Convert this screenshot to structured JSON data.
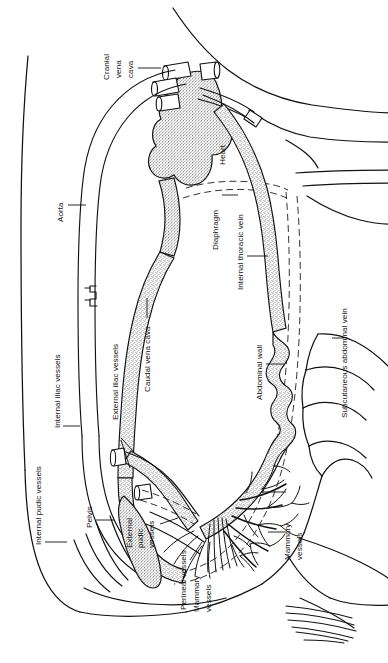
{
  "figure": {
    "kind": "anatomical-line-drawing",
    "orientation": "rotated-90",
    "background_color": "#ffffff",
    "ink_color": "#111111"
  },
  "labels": {
    "cranial_vena_cava": "Cranial\nvena\ncava",
    "cranial_vena_cava_l1": "Cranial",
    "cranial_vena_cava_l2": "vena",
    "cranial_vena_cava_l3": "cava",
    "heart": "Heart",
    "aorta": "Aorta",
    "diaphragm": "Diaphragm",
    "internal_thoracic_vein": "Internal thoracic vein",
    "caudal_vena_cava": "Caudal vena cava",
    "abdominal_wall": "Abdominal wall",
    "subcutaneous_abdominal_vein": "Subcutaneous abdominal vein",
    "external_iliac_vessels": "External iliac vessels",
    "internal_iliac_vessels": "Internal iliac vessels",
    "internal_pudic_vessels": "Internal pudic vessels",
    "pelvis": "Pelvis",
    "external_pudic_vessels_l1": "External",
    "external_pudic_vessels_l2": "pudic",
    "external_pudic_vessels_l3": "vessels",
    "perineal_vessels": "Perineal vessels",
    "mammary_vessels_right_l1": "Mammary",
    "mammary_vessels_right_l2": "vessels",
    "mammary_vessels_left_l1": "Mammary",
    "mammary_vessels_left_l2": "vessels"
  },
  "structures": [
    {
      "name": "body-outline",
      "description": "Outer contour of the animal: neck and head at top right, rump at lower left, udder and hind limbs at lower right, tail tuft at bottom right"
    },
    {
      "name": "heart",
      "description": "Stippled heart with great-vessel stubs at top centre"
    },
    {
      "name": "aorta",
      "description": "Unshaded (white) arterial trunk arching from heart caudally along the dorsal body wall"
    },
    {
      "name": "caudal-vena-cava",
      "description": "Stippled venous trunk running parallel and ventral to the aorta"
    },
    {
      "name": "cranial-vena-cava",
      "description": "Short cut vessel stubs entering the heart cranially"
    },
    {
      "name": "internal-thoracic-vein",
      "description": "Stippled vein running along the ventral thoracic floor from the heart"
    },
    {
      "name": "subcutaneous-abdominal-vein",
      "description": "Large tortuous stippled milk vein running along the ventral abdominal wall"
    },
    {
      "name": "abdominal-wall",
      "description": "Dashed double lines indicating the abdominal wall and the diaphragm"
    },
    {
      "name": "pelvis",
      "description": "Elongated stippled pelvic bone in the caudal region"
    },
    {
      "name": "iliac-vessels",
      "description": "Internal and external iliac vessels branching caudally towards the pelvis and hind limb"
    },
    {
      "name": "pudic-vessels",
      "description": "Internal and external pudic vessels supplying the udder and perineum"
    },
    {
      "name": "mammary-vessels",
      "description": "Dense arborising vessel tree spreading over the udder"
    },
    {
      "name": "perineal-vessels",
      "description": "Slender vessel bundle running caudo-dorsally to the perineum"
    },
    {
      "name": "tail-tuft",
      "description": "Brush of fine hair strokes at the bottom right"
    }
  ]
}
